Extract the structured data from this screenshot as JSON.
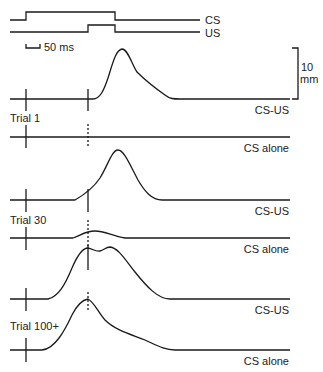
{
  "stimuli": {
    "cs_label": "CS",
    "us_label": "US",
    "time_scale_label": "50 ms"
  },
  "amplitude_scale": {
    "value": "10",
    "unit": "mm"
  },
  "trials": [
    {
      "label": "Trial 1",
      "traces": [
        {
          "label": "CS-US"
        },
        {
          "label": "CS alone"
        }
      ]
    },
    {
      "label": "Trial 30",
      "traces": [
        {
          "label": "CS-US"
        },
        {
          "label": "CS alone"
        }
      ]
    },
    {
      "label": "Trial 100+",
      "traces": [
        {
          "label": "CS-US"
        },
        {
          "label": "CS alone"
        }
      ]
    }
  ],
  "colors": {
    "line": "#1a1a1a",
    "background": "#ffffff"
  }
}
